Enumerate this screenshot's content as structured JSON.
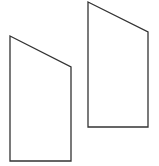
{
  "canvas": {
    "width": 159,
    "height": 166,
    "background": "#ffffff"
  },
  "style": {
    "stroke": "#333333",
    "stroke_width": 1.3,
    "fill": "#ffffff"
  },
  "shapes": [
    {
      "name": "left-trapezoid",
      "points": "10,36 71,67 71,161 10,161"
    },
    {
      "name": "right-trapezoid",
      "points": "88,2 148,32 148,127 88,127"
    }
  ]
}
